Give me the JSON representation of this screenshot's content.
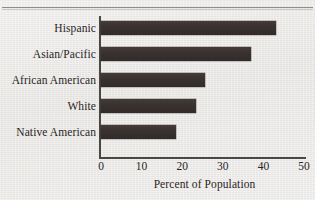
{
  "chart_data": {
    "type": "bar",
    "orientation": "horizontal",
    "title": "",
    "xlabel": "Percent of Population",
    "ylabel": "",
    "categories": [
      "Hispanic",
      "Asian/Pacific",
      "African American",
      "White",
      "Native American"
    ],
    "values": [
      43,
      37,
      25.5,
      23.5,
      18.5
    ],
    "xlim": [
      0,
      50
    ],
    "xticks": [
      0,
      10,
      20,
      30,
      40,
      50
    ],
    "xtick_labels": [
      "0",
      "10",
      "20",
      "30",
      "40",
      "50"
    ],
    "grid": false,
    "legend": null,
    "bar_color": "#3a3230",
    "background_color": "#ebeae7",
    "axis_color": "#4a4745"
  },
  "figure": {
    "axis_title": "Percent of Population",
    "top_rule": ""
  }
}
